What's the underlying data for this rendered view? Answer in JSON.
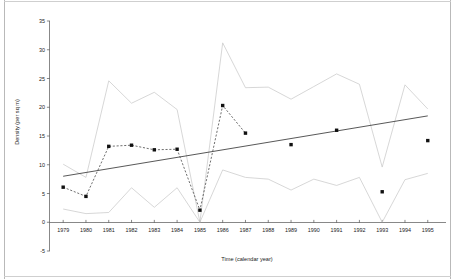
{
  "chart_data": {
    "type": "line",
    "title": "",
    "xlabel": "Time (calendar year)",
    "ylabel": "Density (per sq m)",
    "xlim": [
      1978.4,
      1995.8
    ],
    "ylim": [
      -5,
      35
    ],
    "grid": false,
    "legend": "none",
    "x_ticks": [
      "1979",
      "1980",
      "1981",
      "1982",
      "1983",
      "1984",
      "1985",
      "1986",
      "1987",
      "1988",
      "1989",
      "1990",
      "1991",
      "1992",
      "1993",
      "1994",
      "1995"
    ],
    "y_ticks": [
      "-5",
      "0",
      "5",
      "10",
      "15",
      "20",
      "25",
      "30",
      "35"
    ],
    "categories": [
      1979,
      1980,
      1981,
      1982,
      1983,
      1984,
      1985,
      1986,
      1987,
      1988,
      1989,
      1990,
      1991,
      1992,
      1993,
      1994,
      1995
    ],
    "series": [
      {
        "name": "Observed density",
        "style": "dashed-line-with-square-markers",
        "color": "#111111",
        "x": [
          1979,
          1980,
          1981,
          1982,
          1983,
          1984,
          1985,
          1986,
          1987,
          1989,
          1991,
          1993,
          1995
        ],
        "values": [
          6.1,
          4.5,
          13.2,
          13.4,
          12.6,
          12.7,
          2.1,
          20.3,
          15.5,
          13.5,
          16.0,
          5.3,
          14.2
        ],
        "connected_through": [
          1979,
          1980,
          1981,
          1982,
          1983,
          1984,
          1985,
          1986,
          1987
        ]
      },
      {
        "name": "Upper confidence limit",
        "style": "thin-solid-line",
        "color": "#c9c9c9",
        "x": [
          1979,
          1980,
          1981,
          1982,
          1983,
          1984,
          1985,
          1986,
          1987,
          1988,
          1989,
          1990,
          1991,
          1992,
          1993,
          1994,
          1995
        ],
        "values": [
          10.1,
          7.8,
          24.6,
          20.7,
          22.6,
          19.6,
          0.0,
          31.2,
          23.4,
          23.5,
          21.4,
          23.6,
          25.8,
          24.0,
          9.6,
          23.9,
          19.7
        ]
      },
      {
        "name": "Lower confidence limit",
        "style": "thin-solid-line",
        "color": "#c9c9c9",
        "x": [
          1979,
          1980,
          1981,
          1982,
          1983,
          1984,
          1985,
          1986,
          1987,
          1988,
          1989,
          1990,
          1991,
          1992,
          1993,
          1994,
          1995
        ],
        "values": [
          2.3,
          1.5,
          1.7,
          6.0,
          2.6,
          6.0,
          0.0,
          9.1,
          7.8,
          7.5,
          5.6,
          7.5,
          6.4,
          7.8,
          0.0,
          7.4,
          8.5
        ]
      },
      {
        "name": "Linear trend",
        "style": "solid-line",
        "color": "#3a3a3a",
        "x": [
          1979,
          1995
        ],
        "values": [
          8.0,
          18.5
        ]
      }
    ]
  }
}
